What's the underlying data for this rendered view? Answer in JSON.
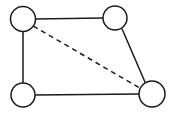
{
  "diagram": {
    "type": "undirected-graph",
    "title": "",
    "canvas": {
      "width": 175,
      "height": 116,
      "background_color": "#ffffff",
      "border": "none"
    },
    "style": {
      "node_fill": "#ffffff",
      "node_stroke": "#1a1a1a",
      "node_stroke_width": 1.5,
      "edge_stroke": "#1a1a1a",
      "edge_stroke_width": 1.5,
      "dash_pattern": "5,4"
    },
    "nodes": [
      {
        "id": "n1",
        "label": "",
        "position_name": "top-left",
        "cx": 23,
        "cy": 19,
        "r": 12.5
      },
      {
        "id": "n2",
        "label": "",
        "position_name": "top-right",
        "cx": 115,
        "cy": 18,
        "r": 12
      },
      {
        "id": "n3",
        "label": "",
        "position_name": "bottom-left",
        "cx": 23,
        "cy": 95,
        "r": 12
      },
      {
        "id": "n4",
        "label": "",
        "position_name": "bottom-right",
        "cx": 152,
        "cy": 94,
        "r": 13
      }
    ],
    "edges": [
      {
        "id": "e1",
        "from": "n1",
        "to": "n2",
        "style": "solid",
        "label": "",
        "x1": 35.5,
        "y1": 19,
        "x2": 103,
        "y2": 18
      },
      {
        "id": "e2",
        "from": "n1",
        "to": "n3",
        "style": "solid",
        "label": "",
        "x1": 23,
        "y1": 31.5,
        "x2": 23,
        "y2": 83
      },
      {
        "id": "e3",
        "from": "n3",
        "to": "n4",
        "style": "solid",
        "label": "",
        "x1": 35,
        "y1": 95,
        "x2": 139,
        "y2": 94
      },
      {
        "id": "e4",
        "from": "n2",
        "to": "n4",
        "style": "solid",
        "label": "",
        "x1": 122,
        "y1": 28.8,
        "x2": 145.5,
        "y2": 83.2
      },
      {
        "id": "e5",
        "from": "n1",
        "to": "n4",
        "style": "dashed",
        "label": "",
        "x1": 33.3,
        "y1": 26.1,
        "x2": 140.7,
        "y2": 88.5
      }
    ]
  }
}
